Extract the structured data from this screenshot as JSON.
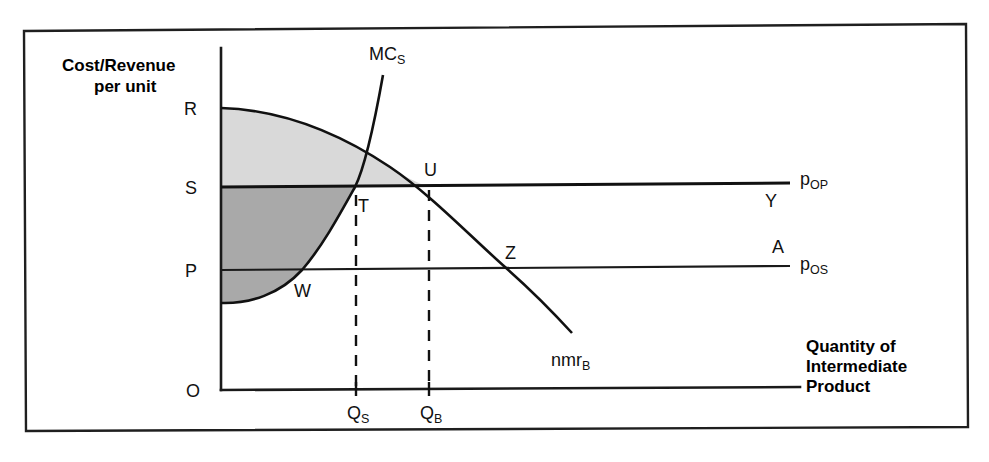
{
  "figure": {
    "kind": "economics-diagram",
    "title_visible": false,
    "frame": {
      "visible": true,
      "color": "#1f1f1f"
    }
  },
  "axes": {
    "y_label_line1": "Cost/Revenue",
    "y_label_line2": "per unit",
    "x_label_line1": "Quantity of",
    "x_label_line2": "Intermediate",
    "x_label_line3": "Product",
    "origin_label": "O"
  },
  "y_axis_marks": [
    {
      "id": "R",
      "label": "R"
    },
    {
      "id": "S",
      "label": "S"
    },
    {
      "id": "P",
      "label": "P"
    }
  ],
  "x_axis_marks": [
    {
      "id": "QS",
      "label": "Q",
      "sub": "S"
    },
    {
      "id": "QB",
      "label": "Q",
      "sub": "B"
    }
  ],
  "curves": [
    {
      "id": "MCS",
      "label": "MC",
      "sub": "S",
      "name": "marginal-cost-supplier"
    },
    {
      "id": "nmrB",
      "label": "nmr",
      "sub": "B",
      "name": "net-marginal-revenue-buyer"
    }
  ],
  "price_lines": [
    {
      "id": "pOP",
      "label": "p",
      "sub": "OP",
      "endpoint_label": "Y",
      "name": "outside-purchase-price-line"
    },
    {
      "id": "pOS",
      "label": "p",
      "sub": "OS",
      "endpoint_label": "A",
      "name": "outside-sale-price-line"
    }
  ],
  "points": [
    {
      "id": "T",
      "label": "T"
    },
    {
      "id": "U",
      "label": "U"
    },
    {
      "id": "W",
      "label": "W"
    },
    {
      "id": "Z",
      "label": "Z"
    }
  ],
  "shading": {
    "upper_region_color": "#d9d9d9",
    "lower_region_color": "#a9a9a9"
  },
  "colors": {
    "ink": "#111111",
    "background": "#ffffff"
  }
}
